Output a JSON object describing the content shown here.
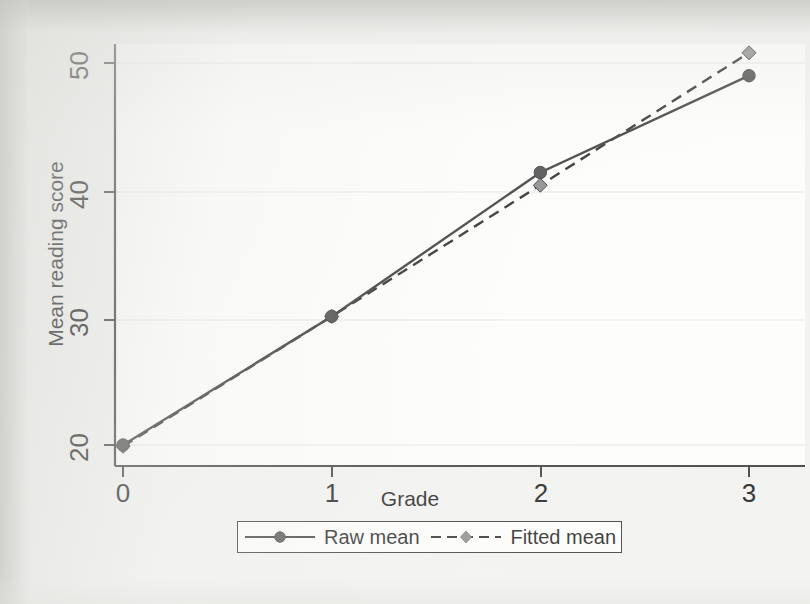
{
  "chart_data": {
    "type": "line",
    "title": "",
    "subtitle": "",
    "xlabel": "Grade",
    "ylabel": "Mean reading score",
    "x": [
      0,
      1,
      2,
      3
    ],
    "xticklabels": [
      "0",
      "1",
      "2",
      "3"
    ],
    "yticklabels": [
      "20",
      "30",
      "40",
      "50"
    ],
    "yticks": [
      20,
      30,
      40,
      50
    ],
    "xlim": [
      -0.07,
      3.0
    ],
    "ylim": [
      18.4,
      52.2
    ],
    "grid": "horizontal-only-faint",
    "legend_position": "below-axes-centered",
    "series": [
      {
        "name": "Raw mean",
        "values": [
          20.0,
          30.1,
          41.4,
          49.0
        ],
        "linestyle": "solid",
        "marker": "circle",
        "color": "#3a3a3a",
        "marker_color": "#4d4d4d"
      },
      {
        "name": "Fitted mean",
        "values": [
          19.9,
          30.1,
          40.4,
          50.8
        ],
        "linestyle": "dashed",
        "marker": "diamond",
        "color": "#2c2c2c",
        "marker_color": "#8c8c8c"
      }
    ],
    "annotations": []
  },
  "axes": {
    "y_title": "Mean reading score",
    "x_title": "Grade",
    "y_ticks": [
      {
        "label": "50",
        "value": 50
      },
      {
        "label": "40",
        "value": 40
      },
      {
        "label": "30",
        "value": 30
      },
      {
        "label": "20",
        "value": 20
      }
    ],
    "x_ticks": [
      {
        "label": "0",
        "value": 0
      },
      {
        "label": "1",
        "value": 1
      },
      {
        "label": "2",
        "value": 2
      },
      {
        "label": "3",
        "value": 3
      }
    ]
  },
  "legend": {
    "entries": [
      {
        "label": "Raw mean",
        "style": "solid-circle"
      },
      {
        "label": "Fitted mean",
        "style": "dashed-diamond"
      }
    ]
  },
  "colors": {
    "page_background": "#f2f2f0",
    "plot_background": "#fdfdfc",
    "axis_line": "#3f3f3f",
    "grid_line": "#e9e9ec",
    "raw_line": "#3a3a3a",
    "raw_marker": "#4d4d4d",
    "fitted_line": "#2c2c2c",
    "fitted_marker": "#8c8c8c",
    "text": "#1d1d1d"
  }
}
